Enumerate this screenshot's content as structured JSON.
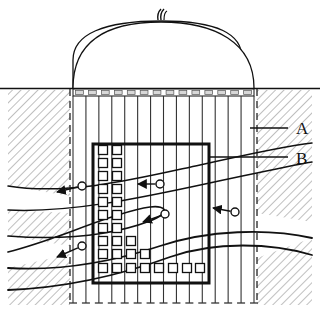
{
  "figure": {
    "labels": [
      {
        "id": "A",
        "text": "A",
        "x": 296,
        "y": 134,
        "leader_x1": 250,
        "leader_x2": 288,
        "leader_y": 128,
        "meaning": "surrounding-hatched-ground"
      },
      {
        "id": "B",
        "text": "B",
        "x": 296,
        "y": 164,
        "leader_x1": 210,
        "leader_x2": 288,
        "leader_y": 157,
        "meaning": "inner-reinforced-block"
      }
    ],
    "dome": {
      "name": "dome-shell",
      "left_x": 73,
      "right_x": 254,
      "base_y": 88,
      "apex_y": 21,
      "vent": {
        "name": "dome-apex-vent",
        "x": 161,
        "y": 12
      }
    },
    "ground_line": {
      "name": "ground-surface-line",
      "y": 88,
      "x1": 0,
      "x2": 320
    },
    "surface_band": {
      "name": "surface-slab-band",
      "x1": 73,
      "x2": 254,
      "y": 89,
      "height": 7,
      "segments": 14
    },
    "columns": {
      "name": "vertical-anchor-columns",
      "count": 15,
      "x1": 73,
      "x2": 254,
      "top_y": 96,
      "bottom_y": 303,
      "foot_tick_width": 8
    },
    "dashed_boundaries": [
      {
        "name": "dashed-boundary-left",
        "x": 70,
        "y1": 89,
        "y2": 305
      },
      {
        "name": "dashed-boundary-right",
        "x": 257,
        "y1": 89,
        "y2": 305
      }
    ],
    "inner_box": {
      "name": "inner-reinforced-block",
      "x": 93,
      "y": 144,
      "width": 116,
      "height": 139,
      "stroke_width": 3
    },
    "strata_curves": [
      {
        "name": "strata-curve-upper",
        "note": "upper stratum boundary, descends left to right dipping left"
      },
      {
        "name": "strata-curve-middle",
        "note": "middle stratum boundary with hooked re-entrant"
      },
      {
        "name": "strata-curve-lower",
        "note": "lower stratum boundary arcing upward to the right"
      }
    ],
    "hatch_regions": [
      {
        "name": "hatch-region-upper-left",
        "angle_deg": 45
      },
      {
        "name": "hatch-region-middle-left",
        "angle_deg": 45
      },
      {
        "name": "hatch-region-lower-left",
        "angle_deg": 45
      },
      {
        "name": "hatch-region-upper-right",
        "angle_deg": 45
      },
      {
        "name": "hatch-region-lower-right",
        "angle_deg": 45
      }
    ],
    "flow_arrows": [
      {
        "name": "flow-arrow-1",
        "tail_x": 82,
        "tail_y": 186,
        "tip_x": 57,
        "tip_y": 192
      },
      {
        "name": "flow-arrow-2",
        "tail_x": 160,
        "tail_y": 184,
        "tip_x": 138,
        "tip_y": 184
      },
      {
        "name": "flow-arrow-3",
        "tail_x": 165,
        "tail_y": 214,
        "tip_x": 143,
        "tip_y": 222
      },
      {
        "name": "flow-arrow-4",
        "tail_x": 235,
        "tail_y": 212,
        "tip_x": 213,
        "tip_y": 208
      },
      {
        "name": "flow-arrow-5",
        "tail_x": 82,
        "tail_y": 246,
        "tip_x": 57,
        "tip_y": 257
      }
    ],
    "anchor_square_grid": {
      "name": "anchor-square-grid",
      "square_size": 9,
      "col_x": [
        103,
        117,
        131,
        145,
        159,
        173,
        187,
        200
      ],
      "row_y": [
        150,
        163,
        176,
        189,
        202,
        215,
        228,
        241,
        254,
        268
      ],
      "pattern": [
        [
          1,
          1,
          0,
          0,
          0,
          0,
          0,
          0
        ],
        [
          1,
          1,
          0,
          0,
          0,
          0,
          0,
          0
        ],
        [
          1,
          1,
          0,
          0,
          0,
          0,
          0,
          0
        ],
        [
          1,
          1,
          0,
          0,
          0,
          0,
          0,
          0
        ],
        [
          1,
          1,
          0,
          0,
          0,
          0,
          0,
          0
        ],
        [
          1,
          1,
          0,
          0,
          0,
          0,
          0,
          0
        ],
        [
          1,
          1,
          0,
          0,
          0,
          0,
          0,
          0
        ],
        [
          1,
          1,
          1,
          0,
          0,
          0,
          0,
          0
        ],
        [
          1,
          1,
          1,
          1,
          0,
          0,
          0,
          0
        ],
        [
          1,
          1,
          1,
          1,
          1,
          1,
          1,
          1
        ]
      ]
    },
    "colors": {
      "ink": "#111111",
      "hatch": "#777777",
      "thin": "#444444",
      "paper": "#ffffff"
    }
  }
}
